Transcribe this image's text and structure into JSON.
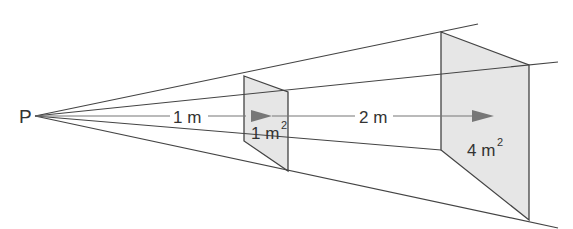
{
  "diagram": {
    "type": "inverse-square-law",
    "point_label": "P",
    "distance_1": "1 m",
    "distance_2": "2 m",
    "area_1": "1 m",
    "area_1_exp": "2",
    "area_2": "4 m",
    "area_2_exp": "2",
    "colors": {
      "line": "#444444",
      "plane_fill": "#e6e6e6",
      "arrow": "#777777",
      "text": "#333333"
    }
  }
}
